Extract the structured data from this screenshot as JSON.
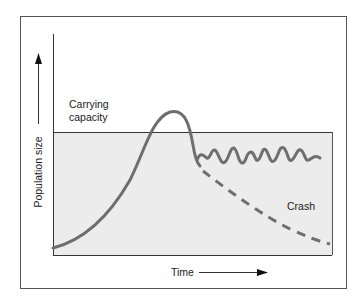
{
  "diagram": {
    "labels": {
      "carrying_capacity_line1": "Carrying",
      "carrying_capacity_line2": "capacity",
      "crash": "Crash",
      "x_axis": "Time",
      "y_axis": "Population size"
    },
    "colors": {
      "curve": "#6e6e6e",
      "shade": "#ececec",
      "axis": "#333333",
      "border": "#555555"
    },
    "curves": [
      {
        "name": "growth-and-overshoot",
        "style": "solid",
        "description": "Exponential growth overshooting carrying capacity, then dropping"
      },
      {
        "name": "oscillation",
        "style": "solid",
        "description": "Population oscillates around carrying capacity"
      },
      {
        "name": "crash",
        "style": "dashed",
        "description": "Population crashes well below carrying capacity"
      }
    ]
  }
}
